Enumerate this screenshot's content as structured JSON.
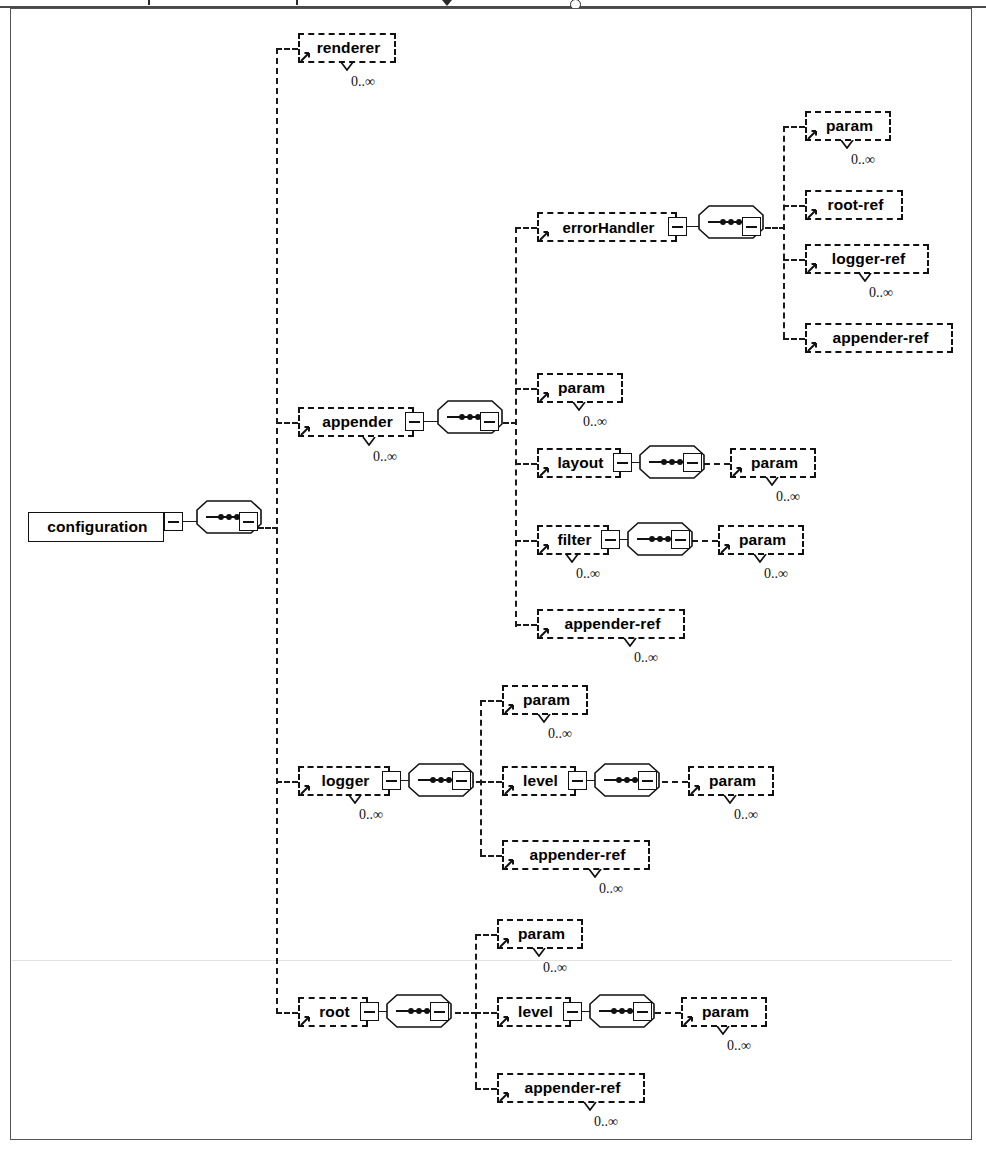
{
  "diagram": {
    "type": "xsd-element-tree",
    "cardinality_unbounded": "0..∞",
    "colors": {
      "line": "#111111",
      "shadow": "#b9b9b9",
      "frame": "#555555",
      "background": "#ffffff"
    },
    "legend": {
      "solid_border_meaning": "required element",
      "dashed_border_meaning": "optional element",
      "octagon_meaning": "sequence compositor",
      "minus_box_meaning": "collapse / expand children"
    }
  },
  "nodes": {
    "configuration": {
      "label": "configuration",
      "required": true,
      "cardinality": ""
    },
    "renderer": {
      "label": "renderer",
      "required": false,
      "cardinality": "0..∞"
    },
    "appender": {
      "label": "appender",
      "required": false,
      "cardinality": "0..∞"
    },
    "errorHandler": {
      "label": "errorHandler",
      "required": false,
      "cardinality": ""
    },
    "eh_param": {
      "label": "param",
      "required": false,
      "cardinality": "0..∞"
    },
    "eh_root_ref": {
      "label": "root-ref",
      "required": false,
      "cardinality": ""
    },
    "eh_logger_ref": {
      "label": "logger-ref",
      "required": false,
      "cardinality": "0..∞"
    },
    "eh_appender_ref": {
      "label": "appender-ref",
      "required": false,
      "cardinality": ""
    },
    "ap_param": {
      "label": "param",
      "required": false,
      "cardinality": "0..∞"
    },
    "layout": {
      "label": "layout",
      "required": false,
      "cardinality": ""
    },
    "layout_param": {
      "label": "param",
      "required": false,
      "cardinality": "0..∞"
    },
    "filter": {
      "label": "filter",
      "required": false,
      "cardinality": "0..∞"
    },
    "filter_param": {
      "label": "param",
      "required": false,
      "cardinality": "0..∞"
    },
    "ap_appender_ref": {
      "label": "appender-ref",
      "required": false,
      "cardinality": "0..∞"
    },
    "logger": {
      "label": "logger",
      "required": false,
      "cardinality": "0..∞"
    },
    "lg_param": {
      "label": "param",
      "required": false,
      "cardinality": "0..∞"
    },
    "lg_level": {
      "label": "level",
      "required": false,
      "cardinality": ""
    },
    "lg_level_param": {
      "label": "param",
      "required": false,
      "cardinality": "0..∞"
    },
    "lg_appender_ref": {
      "label": "appender-ref",
      "required": false,
      "cardinality": "0..∞"
    },
    "root": {
      "label": "root",
      "required": false,
      "cardinality": ""
    },
    "rt_param": {
      "label": "param",
      "required": false,
      "cardinality": "0..∞"
    },
    "rt_level": {
      "label": "level",
      "required": false,
      "cardinality": ""
    },
    "rt_level_param": {
      "label": "param",
      "required": false,
      "cardinality": "0..∞"
    },
    "rt_appender_ref": {
      "label": "appender-ref",
      "required": false,
      "cardinality": "0..∞"
    }
  }
}
